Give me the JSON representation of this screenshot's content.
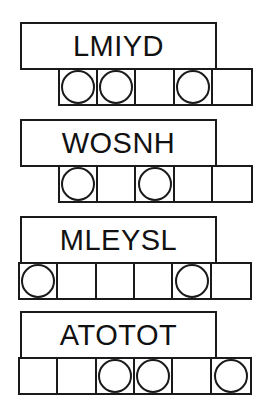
{
  "sheet": {
    "title": "word puzzle worksheet",
    "background_color": "#ffffff",
    "ink_color": "#1a1a1a"
  },
  "rows": [
    {
      "word": "LMIYD",
      "word_box": {
        "left": 20,
        "top": 22,
        "width": 197,
        "height": 48
      },
      "grid": {
        "left": 58,
        "top": 68,
        "cell_width": 39,
        "height": 38,
        "cell_count": 5,
        "circled_positions": [
          1,
          2,
          4
        ],
        "cells": [
          {
            "index": 1,
            "circled": true
          },
          {
            "index": 2,
            "circled": true
          },
          {
            "index": 3,
            "circled": false
          },
          {
            "index": 4,
            "circled": true
          },
          {
            "index": 5,
            "circled": false
          }
        ]
      }
    },
    {
      "word": "WOSNH",
      "word_box": {
        "left": 20,
        "top": 119,
        "width": 197,
        "height": 48
      },
      "grid": {
        "left": 58,
        "top": 165,
        "cell_width": 39,
        "height": 38,
        "cell_count": 5,
        "circled_positions": [
          1,
          3
        ],
        "cells": [
          {
            "index": 1,
            "circled": true
          },
          {
            "index": 2,
            "circled": false
          },
          {
            "index": 3,
            "circled": true
          },
          {
            "index": 4,
            "circled": false
          },
          {
            "index": 5,
            "circled": false
          }
        ]
      }
    },
    {
      "word": "MLEYSL",
      "word_box": {
        "left": 20,
        "top": 216,
        "width": 197,
        "height": 48
      },
      "grid": {
        "left": 18,
        "top": 262,
        "cell_width": 39,
        "height": 38,
        "cell_count": 6,
        "circled_positions": [
          1,
          5
        ],
        "cells": [
          {
            "index": 1,
            "circled": true
          },
          {
            "index": 2,
            "circled": false
          },
          {
            "index": 3,
            "circled": false
          },
          {
            "index": 4,
            "circled": false
          },
          {
            "index": 5,
            "circled": true
          },
          {
            "index": 6,
            "circled": false
          }
        ]
      }
    },
    {
      "word": "ATOTOT",
      "word_box": {
        "left": 20,
        "top": 311,
        "width": 197,
        "height": 48
      },
      "grid": {
        "left": 18,
        "top": 357,
        "cell_width": 39,
        "height": 38,
        "cell_count": 6,
        "circled_positions": [
          3,
          4,
          6
        ],
        "cells": [
          {
            "index": 1,
            "circled": false
          },
          {
            "index": 2,
            "circled": false
          },
          {
            "index": 3,
            "circled": true
          },
          {
            "index": 4,
            "circled": true
          },
          {
            "index": 5,
            "circled": false
          },
          {
            "index": 6,
            "circled": true
          }
        ]
      }
    }
  ]
}
